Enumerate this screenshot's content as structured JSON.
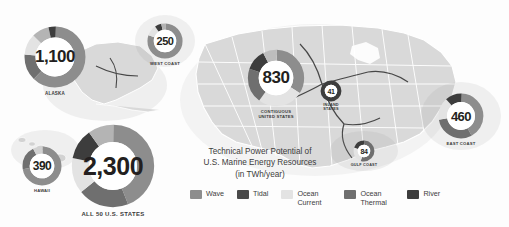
{
  "title": {
    "line1": "Technical Power Potential of",
    "line2": "U.S. Marine Energy Resources",
    "line3": "(in TWh/year)"
  },
  "palette": {
    "wave": "#8d8d8d",
    "tidal": "#4a4a4a",
    "ocean_current": "#e3e3e3",
    "ocean_thermal": "#6f6f6f",
    "river": "#3d3d3d",
    "map_land": "#d8d8d8",
    "map_border": "#ffffff",
    "text": "#3c3c3c",
    "number": "#231f20"
  },
  "legend": {
    "items": [
      {
        "label": "Wave",
        "color": "#8d8d8d"
      },
      {
        "label": "Tidal",
        "color": "#4a4a4a"
      },
      {
        "label": "Ocean Current",
        "color": "#e3e3e3"
      },
      {
        "label": "Ocean Thermal",
        "color": "#6f6f6f"
      },
      {
        "label": "River",
        "color": "#3d3d3d"
      }
    ]
  },
  "chart_data": {
    "type": "pie",
    "title": "Technical Power Potential of U.S. Marine Energy Resources (in TWh/year)",
    "unit": "TWh/year",
    "legend_position": "bottom-center",
    "series_names": [
      "Wave",
      "Tidal",
      "Ocean Current",
      "Ocean Thermal",
      "River"
    ],
    "donuts": [
      {
        "key": "alaska",
        "label": "ALASKA",
        "total": "1,100",
        "total_value": 1100,
        "slices": [
          {
            "name": "Wave",
            "pct": 62,
            "color": "#8d8d8d"
          },
          {
            "name": "Ocean Thermal",
            "pct": 14,
            "color": "#6f6f6f"
          },
          {
            "name": "Ocean Current",
            "pct": 11,
            "color": "#e3e3e3"
          },
          {
            "name": "River",
            "pct": 9,
            "color": "#b4b4b4"
          },
          {
            "name": "Tidal",
            "pct": 4,
            "color": "#3d3d3d"
          }
        ]
      },
      {
        "key": "west-coast",
        "label": "WEST COAST",
        "total": "250",
        "total_value": 250,
        "slices": [
          {
            "name": "Wave",
            "pct": 80,
            "color": "#8d8d8d"
          },
          {
            "name": "Ocean Current",
            "pct": 10,
            "color": "#e3e3e3"
          },
          {
            "name": "Tidal",
            "pct": 6,
            "color": "#3d3d3d"
          },
          {
            "name": "River",
            "pct": 4,
            "color": "#b4b4b4"
          }
        ]
      },
      {
        "key": "contiguous-united-states",
        "label": "CONTIGUOUS\nUNITED STATES",
        "label_line1": "CONTIGUOUS",
        "label_line2": "UNITED STATES",
        "total": "830",
        "total_value": 830,
        "slices": [
          {
            "name": "Wave",
            "pct": 34,
            "color": "#8d8d8d"
          },
          {
            "name": "Ocean Current",
            "pct": 26,
            "color": "#e3e3e3"
          },
          {
            "name": "Ocean Thermal",
            "pct": 20,
            "color": "#6f6f6f"
          },
          {
            "name": "Tidal",
            "pct": 12,
            "color": "#3d3d3d"
          },
          {
            "name": "River",
            "pct": 8,
            "color": "#bdbdbd"
          }
        ]
      },
      {
        "key": "inland-states",
        "label": "INLAND STATES",
        "label_line1": "INLAND",
        "label_line2": "STATES",
        "total": "41",
        "total_value": 41,
        "slices": [
          {
            "name": "River",
            "pct": 100,
            "color": "#3d3d3d"
          }
        ]
      },
      {
        "key": "gulf-coast",
        "label": "GULF COAST",
        "total": "84",
        "total_value": 84,
        "slices": [
          {
            "name": "Ocean Thermal",
            "pct": 55,
            "color": "#6f6f6f"
          },
          {
            "name": "Ocean Current",
            "pct": 25,
            "color": "#e3e3e3"
          },
          {
            "name": "River",
            "pct": 20,
            "color": "#3d3d3d"
          }
        ]
      },
      {
        "key": "east-coast",
        "label": "EAST COAST",
        "total": "460",
        "total_value": 460,
        "slices": [
          {
            "name": "Ocean Current",
            "pct": 42,
            "color": "#8d8d8d"
          },
          {
            "name": "Wave",
            "pct": 30,
            "color": "#6f6f6f"
          },
          {
            "name": "Ocean Thermal",
            "pct": 16,
            "color": "#e3e3e3"
          },
          {
            "name": "Tidal",
            "pct": 12,
            "color": "#3d3d3d"
          }
        ]
      },
      {
        "key": "hawaii",
        "label": "HAWAII",
        "total": "390",
        "total_value": 390,
        "slices": [
          {
            "name": "Ocean Thermal",
            "pct": 72,
            "color": "#8d8d8d"
          },
          {
            "name": "Wave",
            "pct": 20,
            "color": "#6f6f6f"
          },
          {
            "name": "Ocean Current",
            "pct": 8,
            "color": "#d0d0d0"
          }
        ]
      },
      {
        "key": "all-50-us-states",
        "label": "ALL 50 U.S. STATES",
        "total": "2,300",
        "total_value": 2300,
        "slices": [
          {
            "name": "Wave",
            "pct": 44,
            "color": "#8d8d8d"
          },
          {
            "name": "Ocean Thermal",
            "pct": 20,
            "color": "#6f6f6f"
          },
          {
            "name": "Ocean Current",
            "pct": 14,
            "color": "#e3e3e3"
          },
          {
            "name": "Tidal",
            "pct": 12,
            "color": "#3d3d3d"
          },
          {
            "name": "River",
            "pct": 10,
            "color": "#b4b4b4"
          }
        ]
      }
    ]
  }
}
